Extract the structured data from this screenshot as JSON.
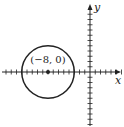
{
  "diagram": {
    "type": "coordinate-plane",
    "x_axis_label": "x",
    "y_axis_label": "y",
    "x_tick_range": [
      -16,
      6
    ],
    "y_tick_range": [
      -10,
      11
    ],
    "circle": {
      "center": [
        -8,
        0
      ],
      "radius": 5,
      "center_label": "(−8, 0)"
    },
    "colors": {
      "stroke": "#222222",
      "background": "#ffffff"
    }
  }
}
